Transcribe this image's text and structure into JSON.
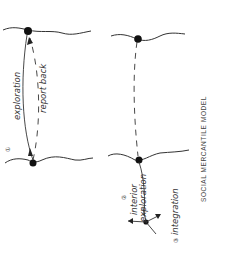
{
  "diagram": {
    "title": "SOCIAL MERCANTILE MODEL",
    "colors": {
      "ink": "#222222",
      "background": "#ffffff"
    },
    "left_panel": {
      "step_number": "①",
      "labels": {
        "exploration": "exploration",
        "report_back": "report back"
      }
    },
    "right_panel": {
      "step2_number": "②",
      "step2_label_line1": "interior",
      "step2_label_line2": "exploration",
      "step3_number": "③",
      "step3_label": "integration"
    }
  }
}
